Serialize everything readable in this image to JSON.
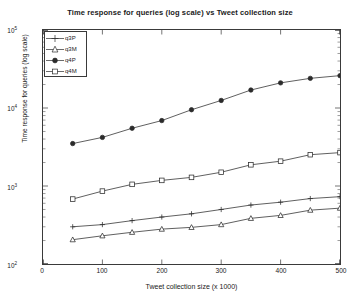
{
  "chart_data": {
    "type": "line",
    "title": "Time response for queries (log scale) vs Tweet collection size",
    "xlabel": "Tweet collection size (x 1000)",
    "ylabel": "Time response for queries (log scale)",
    "xlim": [
      0,
      500
    ],
    "ylim": [
      100,
      100000
    ],
    "yscale": "log",
    "xscale": "linear",
    "grid": false,
    "legend_position": "upper left",
    "xticks": [
      "0",
      "100",
      "200",
      "300",
      "400",
      "500"
    ],
    "xtick_values": [
      0,
      100,
      200,
      300,
      400,
      500
    ],
    "yticks": [
      "10^2",
      "10^3",
      "10^4",
      "10^5"
    ],
    "ytick_values": [
      100,
      1000,
      10000,
      100000
    ],
    "x": [
      50,
      100,
      150,
      200,
      250,
      300,
      350,
      400,
      450,
      500
    ],
    "series": [
      {
        "name": "q3P",
        "marker": "plus",
        "values": [
          300,
          320,
          360,
          400,
          440,
          500,
          570,
          620,
          690,
          730
        ]
      },
      {
        "name": "q3M",
        "marker": "triangle",
        "values": [
          205,
          230,
          255,
          280,
          295,
          320,
          385,
          420,
          490,
          520
        ]
      },
      {
        "name": "q4P",
        "marker": "filled-circle",
        "values": [
          3500,
          4200,
          5500,
          6900,
          9500,
          12500,
          17000,
          21000,
          24000,
          26000
        ]
      },
      {
        "name": "q4M",
        "marker": "square",
        "values": [
          680,
          860,
          1050,
          1180,
          1290,
          1500,
          1870,
          2080,
          2520,
          2680
        ]
      }
    ]
  }
}
